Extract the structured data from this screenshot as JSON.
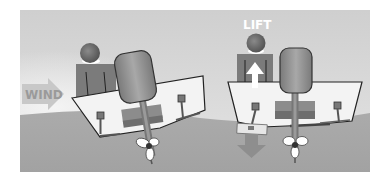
{
  "diagram": {
    "title": "",
    "labels": {
      "wind": "WIND",
      "lift": "LIFT"
    },
    "panels": [
      {
        "name": "left-boat",
        "description": "Boat heeling under wind force"
      },
      {
        "name": "right-boat",
        "description": "Boat level with lift force"
      }
    ],
    "colors": {
      "background": "#ffffff",
      "sky": "#d9d9d9",
      "water": "#a9a9a9",
      "hull": "#f2f2f2",
      "hull_outline": "#2a2a2a",
      "person_body": "#7d7d7d",
      "person_head": "#6a6a6a",
      "engine": "#8f8f8f",
      "arrow_wind": "#c4c4c4",
      "arrow_lift": "#ffffff",
      "arrow_down": "#8a8a8a",
      "label_wind": "#9a9a9a",
      "label_lift": "#ffffff"
    }
  }
}
